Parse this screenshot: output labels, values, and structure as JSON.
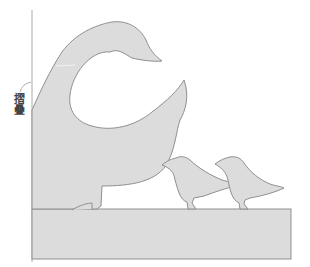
{
  "illustration": {
    "subject": "goose-and-two-chicks-silhouette",
    "label_text": "摺疊",
    "colors": {
      "fill": "#dcdcdc",
      "stroke": "#8f8f8f",
      "background": "#ffffff",
      "fold_line": "#9a9a9a"
    }
  }
}
